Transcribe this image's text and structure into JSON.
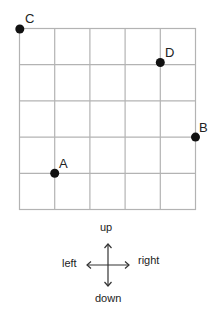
{
  "grid": {
    "columns": 5,
    "rows": 5,
    "line_color": "#b3b3b3"
  },
  "points": [
    {
      "label": "A",
      "col": 1,
      "row": 4
    },
    {
      "label": "B",
      "col": 5,
      "row": 3
    },
    {
      "label": "C",
      "col": 0,
      "row": 0
    },
    {
      "label": "D",
      "col": 4,
      "row": 1
    }
  ],
  "compass": {
    "up": "up",
    "down": "down",
    "left": "left",
    "right": "right"
  }
}
